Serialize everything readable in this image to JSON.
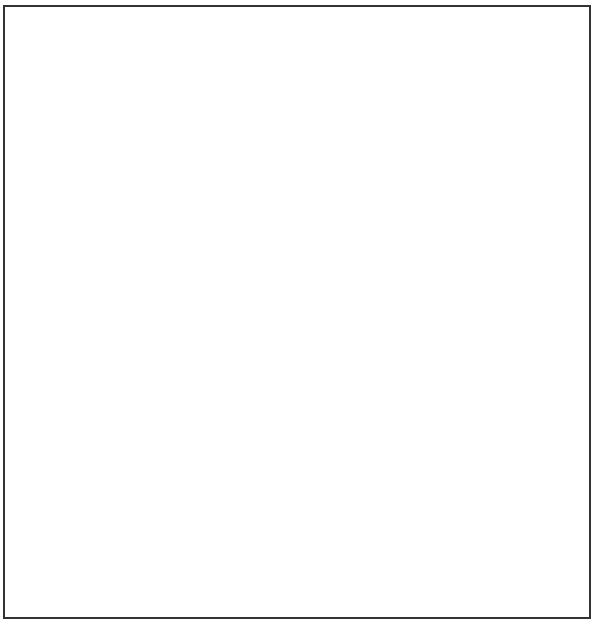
{
  "illustration": {
    "subject": "igloo",
    "style": "black ink line art with stipple shading",
    "colors": {
      "ink": "#111111",
      "paper": "#ffffff",
      "frame": "#333333"
    },
    "dome_silhouette": "M 20 370 C 20 330, 30 300, 45 270 C 60 230, 80 195, 105 170 C 130 140, 165 115, 205 100 L 215 78 C 230 60, 300 50, 350 68 L 352 95 C 390 100, 420 120, 440 150 C 470 185, 490 220, 500 260 C 515 300, 535 330, 537 370 C 540 410, 530 440, 500 460 C 460 480, 380 490, 300 485 C 240 482, 190 478, 150 465 C 100 450, 60 430, 40 405 C 25 390, 20 380, 20 370 Z",
    "chimney": {
      "top": "M 208 78 C 225 58, 300 50, 350 68 L 353 95 C 340 110, 320 118, 300 120 C 270 124, 240 120, 212 105 Z",
      "front_left": "M 208 78 L 212 105 L 218 138 L 212 110 Z",
      "body": "M 208 78 L 212 105 C 240 120, 270 124, 300 120 C 320 118, 340 110, 353 95 L 350 125 C 340 136, 320 142, 300 144 C 270 146, 240 143, 218 133 Z",
      "edges": [
        "M 210 82 L 218 135",
        "M 250 117 L 252 145",
        "M 310 120 L 307 143",
        "M 350 96 L 348 128"
      ]
    },
    "row_lines": [
      "M 160 145 C 175 128, 195 118, 212 112",
      "M 353 100 C 375 108, 395 118, 405 130",
      "M 165 150 C 200 170, 270 190, 330 180 C 370 172, 400 160, 415 140",
      "M 110 190 C 150 230, 260 260, 340 240 C 400 225, 430 205, 445 180",
      "M 68 250 C 100 290, 200 320, 300 316 C 390 312, 460 280, 495 235",
      "M 35 320 C 80 360, 190 390, 290 388 C 400 385, 480 340, 510 285",
      "M 25 375 C 60 420, 170 440, 270 440 C 380 440, 470 405, 528 355",
      "M 150 466 C 200 478, 250 483, 300 483 C 390 483, 470 465, 520 420",
      "M 270 470 C 330 475, 420 465, 470 445",
      "M 105 185 C 95 205, 80 230, 68 250",
      "M 60 260 C 45 285, 35 310, 33 330",
      "M 30 330 C 22 345, 20 365, 25 380"
    ],
    "joints": [
      "M 165 152 L 185 125",
      "M 245 147 L 232 188",
      "M 305 143 L 330 180",
      "M 405 130 L 435 178",
      "M 120 200 L 100 250",
      "M 232 190 L 225 248",
      "M 335 182 L 345 240",
      "M 430 180 L 450 228",
      "M 95 262 L 80 312",
      "M 200 255 L 190 320",
      "M 310 258 L 318 318",
      "M 400 215 L 418 282",
      "M 470 235 L 485 285",
      "M 110 310 L 100 365",
      "M 215 332 L 210 400",
      "M 340 330 L 345 390",
      "M 440 290 L 460 350",
      "M 495 302 L 505 360",
      "M 65 355 L 58 415",
      "M 140 392 L 135 458",
      "M 260 408 L 265 478",
      "M 380 400 L 385 462",
      "M 460 375 L 462 440",
      "M 518 350 L 522 410",
      "M 372 460 L 372 487"
    ],
    "tunnel": {
      "outline": "M 100 448 C 95 470, 75 490, 60 500 C 45 510, 30 520, 20 528 C 35 532, 50 538, 70 540 C 80 548, 95 552, 110 548 C 120 540, 128 530, 140 520 C 150 505, 155 490, 162 475 Z",
      "texture_lines": [
        "M 40 505 C 50 503, 60 506, 70 508",
        "M 45 475 C 55 480, 62 485, 70 492",
        "M 95 540 C 110 545, 130 550, 145 552",
        "M 160 490 C 175 492, 185 492, 200 488",
        "M 150 525 C 170 527, 185 528, 200 525"
      ]
    },
    "stipple_zones": [
      {
        "name": "chimney-right",
        "cx": 330,
        "cy": 95,
        "rx": 28,
        "ry": 30,
        "density": 140
      },
      {
        "name": "upper-right-dome",
        "cx": 390,
        "cy": 165,
        "rx": 65,
        "ry": 65,
        "density": 360
      },
      {
        "name": "right-side-dome",
        "cx": 460,
        "cy": 290,
        "rx": 60,
        "ry": 110,
        "density": 460
      },
      {
        "name": "lower-right-dome",
        "cx": 470,
        "cy": 410,
        "rx": 70,
        "ry": 55,
        "density": 360
      },
      {
        "name": "ground-shadow-right",
        "cx": 520,
        "cy": 440,
        "rx": 65,
        "ry": 60,
        "density": 260
      },
      {
        "name": "tunnel-shade",
        "cx": 100,
        "cy": 500,
        "rx": 60,
        "ry": 50,
        "density": 520
      },
      {
        "name": "ground-front",
        "cx": 300,
        "cy": 500,
        "rx": 160,
        "ry": 25,
        "density": 140
      },
      {
        "name": "left-bottom-block",
        "cx": 45,
        "cy": 360,
        "rx": 20,
        "ry": 45,
        "density": 40
      },
      {
        "name": "sparse-middle",
        "cx": 290,
        "cy": 300,
        "rx": 170,
        "ry": 140,
        "density": 150
      }
    ]
  }
}
